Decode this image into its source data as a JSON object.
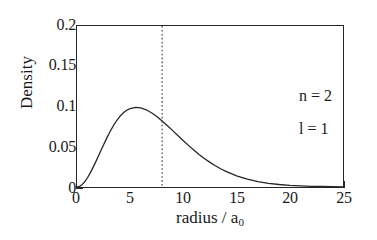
{
  "chart_data": {
    "type": "line",
    "title": "",
    "xlabel": "radius / a",
    "xlabel_sub": "0",
    "ylabel": "Density",
    "xlim": [
      0,
      25
    ],
    "ylim": [
      0,
      0.2
    ],
    "grid": false,
    "legend": "none",
    "xticks": [
      "0",
      "5",
      "10",
      "15",
      "20",
      "25"
    ],
    "xtick_values": [
      0,
      5,
      10,
      15,
      20,
      25
    ],
    "yticks": [
      "0",
      "0.05",
      "0.1",
      "0.15",
      "0.2"
    ],
    "ytick_values": [
      0,
      0.05,
      0.1,
      0.15,
      0.2
    ],
    "series": [
      {
        "name": "radial probability density",
        "style": "solid",
        "color": "#262626",
        "x": [
          0,
          0.25,
          0.5,
          0.75,
          1,
          1.25,
          1.5,
          1.75,
          2,
          2.25,
          2.5,
          2.75,
          3,
          3.25,
          3.5,
          3.75,
          4,
          4.25,
          4.5,
          4.75,
          5,
          5.5,
          6,
          6.5,
          7,
          7.5,
          8,
          8.5,
          9,
          9.5,
          10,
          10.5,
          11,
          11.5,
          12,
          12.5,
          13,
          13.5,
          14,
          15,
          16,
          17,
          18,
          19,
          20,
          21,
          22,
          23,
          24,
          25
        ],
        "y": [
          0,
          0.0008,
          0.0032,
          0.0069,
          0.0118,
          0.0176,
          0.0241,
          0.0309,
          0.0381,
          0.0453,
          0.0525,
          0.0595,
          0.0661,
          0.0723,
          0.0779,
          0.0829,
          0.0872,
          0.0908,
          0.0937,
          0.0959,
          0.0975,
          0.0988,
          0.0982,
          0.0959,
          0.0923,
          0.0876,
          0.0821,
          0.0762,
          0.07,
          0.0637,
          0.0574,
          0.0514,
          0.0456,
          0.0402,
          0.0352,
          0.0306,
          0.0264,
          0.0227,
          0.0194,
          0.0139,
          0.0098,
          0.0068,
          0.0046,
          0.0031,
          0.0021,
          0.0014,
          0.0009,
          0.0006,
          0.0004,
          0.0002
        ],
        "peak_x": 4.0,
        "peak_y": 0.193
      }
    ],
    "annotations": [
      {
        "name": "vertical-marker",
        "type": "vline",
        "x": 8,
        "style": "dotted",
        "color": "#404040"
      },
      {
        "name": "quantum-number-n",
        "type": "text",
        "text": "n = 2",
        "x": 13.6,
        "y": 0.155
      },
      {
        "name": "quantum-number-l",
        "type": "text",
        "text": "l = 1",
        "x": 13.6,
        "y": 0.115
      }
    ]
  },
  "axes": {
    "y_title": "Density",
    "x_title_main": "radius / a",
    "x_title_sub": "0"
  },
  "annotations": {
    "n_label": "n = 2",
    "l_label": "l = 1"
  },
  "colors": {
    "background": "#ffffff",
    "axis": "#262626",
    "curve": "#262626",
    "marker": "#404040"
  }
}
